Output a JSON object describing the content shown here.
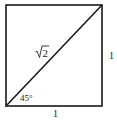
{
  "diagram": {
    "type": "geometry",
    "square": {
      "x": 6,
      "y": 5,
      "size": 96,
      "stroke": "#1a1a1a"
    },
    "diagonal": {
      "from": "bottom-left",
      "to": "top-right",
      "stroke": "#1a1a1a"
    },
    "labels": {
      "diagonal": "√2",
      "diagonal_radicand": "2",
      "angle": "45°",
      "bottom_side": "1",
      "right_side": "1"
    }
  }
}
